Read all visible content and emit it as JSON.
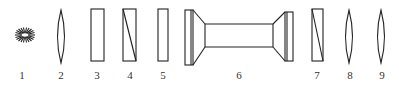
{
  "diagram": {
    "colors": {
      "stroke": "#222222",
      "label": "#333333",
      "background": "#ffffff"
    },
    "elements": [
      {
        "id": 1,
        "label": "1",
        "type": "light-source",
        "icon": "starburst-icon",
        "cx": 25,
        "cy": 35
      },
      {
        "id": 2,
        "label": "2",
        "type": "convex-lens",
        "icon": "lens-icon",
        "cx": 61
      },
      {
        "id": 3,
        "label": "3",
        "type": "plate",
        "icon": "rectangle-icon",
        "x": 91,
        "w": 13
      },
      {
        "id": 4,
        "label": "4",
        "type": "prism-plate",
        "icon": "rectangle-diagonal-icon",
        "x": 123,
        "w": 13
      },
      {
        "id": 5,
        "label": "5",
        "type": "plate",
        "icon": "rectangle-icon",
        "x": 158,
        "w": 10
      },
      {
        "id": 6,
        "label": "6",
        "type": "tube-cell",
        "icon": "tube-icon",
        "x1": 185,
        "x2": 293
      },
      {
        "id": 7,
        "label": "7",
        "type": "prism-plate",
        "icon": "rectangle-diagonal-icon",
        "x": 312,
        "w": 11
      },
      {
        "id": 8,
        "label": "8",
        "type": "convex-lens",
        "icon": "lens-icon",
        "cx": 349
      },
      {
        "id": 9,
        "label": "9",
        "type": "convex-lens",
        "icon": "lens-icon",
        "cx": 381
      }
    ],
    "labels": [
      "1",
      "2",
      "3",
      "4",
      "5",
      "6",
      "7",
      "8",
      "9"
    ]
  }
}
